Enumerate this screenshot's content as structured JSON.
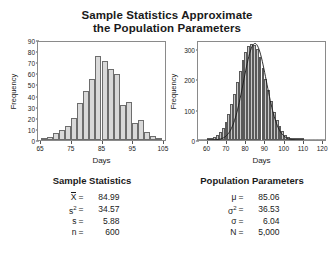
{
  "title_line1": "Sample Statistics Approximate",
  "title_line2": "the Population Parameters",
  "left_panel": {
    "stats_heading": "Sample Statistics",
    "rows": [
      {
        "symbol": "X",
        "overbar": true,
        "eq": "=",
        "value": "84.99"
      },
      {
        "symbol": "s",
        "sup": "2",
        "eq": "=",
        "value": "34.57"
      },
      {
        "symbol": "s",
        "eq": "=",
        "value": "5.88"
      },
      {
        "symbol": "n",
        "eq": "=",
        "value": "600"
      }
    ]
  },
  "right_panel": {
    "stats_heading": "Population Parameters",
    "rows": [
      {
        "symbol": "μ",
        "eq": "=",
        "value": "85.06"
      },
      {
        "symbol": "σ",
        "sup": "2",
        "eq": "=",
        "value": "36.53"
      },
      {
        "symbol": "σ",
        "eq": "=",
        "value": "6.04"
      },
      {
        "symbol": "N",
        "eq": "=",
        "value": "5,000"
      }
    ]
  },
  "chart_data": [
    {
      "type": "bar",
      "id": "sample-histogram",
      "title": "",
      "xlabel": "Days",
      "ylabel": "Frequency",
      "xlim": [
        64,
        106
      ],
      "ylim": [
        0,
        90
      ],
      "xticks": [
        65,
        75,
        85,
        95,
        105
      ],
      "yticks": [
        0,
        10,
        20,
        30,
        40,
        50,
        60,
        70,
        80,
        90
      ],
      "grid": false,
      "legend": "none",
      "bin_width": 2,
      "bin_starts": [
        65,
        67,
        69,
        71,
        73,
        75,
        77,
        79,
        81,
        83,
        85,
        87,
        89,
        91,
        93,
        95,
        97,
        99,
        101,
        103
      ],
      "values": [
        2,
        3,
        6,
        9,
        13,
        20,
        34,
        45,
        56,
        77,
        73,
        65,
        61,
        32,
        35,
        16,
        18,
        7,
        4,
        2
      ],
      "bar_fill": "#d9d9d9",
      "bar_edge": "#6d6d6d"
    },
    {
      "type": "bar",
      "id": "population-histogram",
      "title": "",
      "xlabel": "Days",
      "ylabel": "Frequency",
      "xlim": [
        55,
        122
      ],
      "ylim": [
        0,
        330
      ],
      "xticks": [
        60,
        70,
        80,
        90,
        100,
        110,
        120
      ],
      "yticks": [
        0,
        100,
        200,
        300
      ],
      "grid": false,
      "legend": "none",
      "overlay_curve": "normal",
      "curve_mean": 85.06,
      "curve_sd": 6.04,
      "curve_peak": 325,
      "bin_width": 1.5,
      "bin_starts": [
        60,
        61.5,
        63,
        64.5,
        66,
        67.5,
        69,
        70.5,
        72,
        73.5,
        75,
        76.5,
        78,
        79.5,
        81,
        82.5,
        84,
        85.5,
        87,
        88.5,
        90,
        91.5,
        93,
        94.5,
        96,
        97.5,
        99,
        100.5,
        102,
        103.5,
        105,
        106.5,
        108,
        109.5
      ],
      "values": [
        3,
        6,
        11,
        18,
        28,
        42,
        62,
        88,
        120,
        155,
        196,
        232,
        268,
        298,
        318,
        325,
        320,
        305,
        278,
        242,
        205,
        168,
        130,
        96,
        68,
        46,
        30,
        18,
        11,
        6,
        3,
        2,
        1,
        1
      ],
      "bar_fill": "#c8c8c8",
      "bar_edge": "#5a5a5a",
      "curve_color": "#1a1a1a"
    }
  ]
}
